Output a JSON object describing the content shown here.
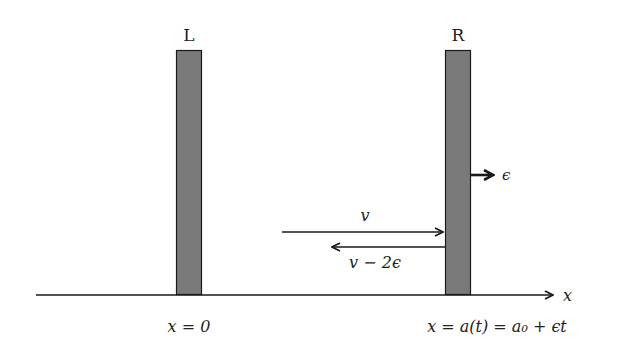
{
  "walls": {
    "left": {
      "label": "L",
      "position_label": "x = 0"
    },
    "right": {
      "label": "R",
      "position_label": "x = a(t) = a₀ + ϵt",
      "velocity_label": "ϵ"
    }
  },
  "axis": {
    "label": "x"
  },
  "arrows": {
    "incoming": {
      "label": "v"
    },
    "reflected": {
      "label": "v − 2ϵ"
    }
  },
  "colors": {
    "wall_fill": "#7a7a7a",
    "stroke": "#1a1a1a"
  }
}
